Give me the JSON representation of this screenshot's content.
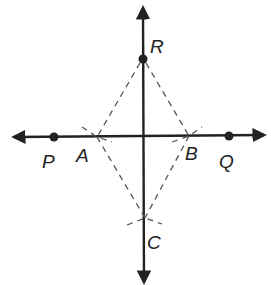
{
  "diagram": {
    "labels": {
      "R": "R",
      "P": "P",
      "A": "A",
      "B": "B",
      "Q": "Q",
      "C": "C"
    },
    "points": {
      "R": [
        143,
        59
      ],
      "P": [
        54,
        137
      ],
      "A": [
        97,
        137
      ],
      "B": [
        189,
        136
      ],
      "Q": [
        229,
        136
      ],
      "C": [
        145,
        218
      ]
    },
    "colors": {
      "line": "#222222",
      "dashed": "#555555",
      "background": "#ffffff"
    }
  }
}
